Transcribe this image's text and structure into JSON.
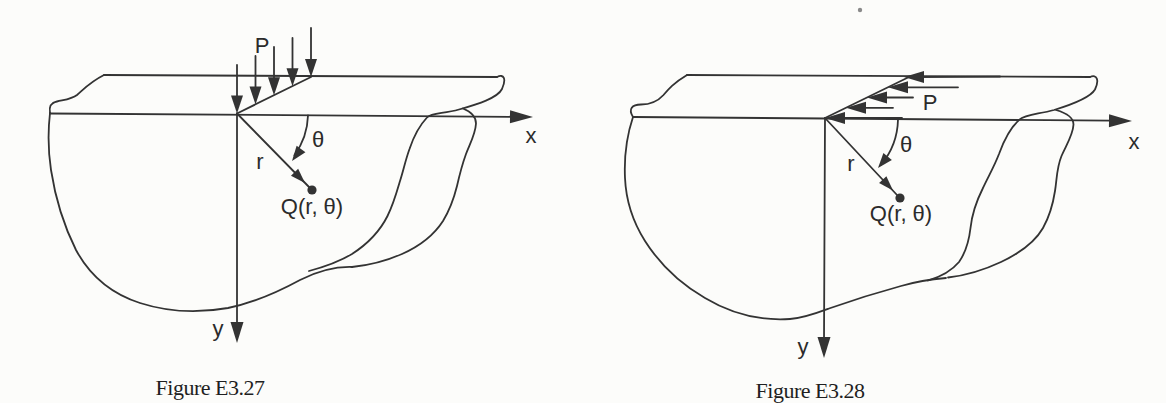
{
  "document": {
    "kind": "scanned textbook figure pair",
    "background_color": "#fcfcfa",
    "ink_color": "#333333"
  },
  "figures": [
    {
      "caption": "Figure E3.27",
      "load_direction": "down",
      "labels": {
        "load": "P",
        "x_axis": "x",
        "y_axis": "y",
        "radius": "r",
        "angle": "θ",
        "point": "Q(r, θ)"
      }
    },
    {
      "caption": "Figure E3.28",
      "load_direction": "left",
      "labels": {
        "load": "P",
        "x_axis": "x",
        "y_axis": "y",
        "radius": "r",
        "angle": "θ",
        "point": "Q(r, θ)"
      }
    }
  ]
}
